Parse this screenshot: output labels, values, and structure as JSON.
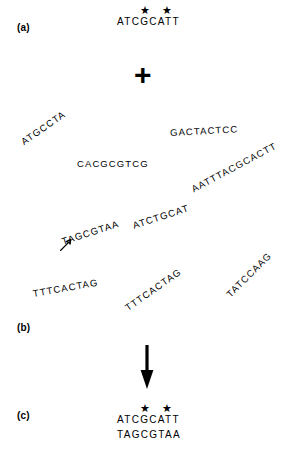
{
  "figure": {
    "background_color": "#ffffff",
    "ink_color": "#000000"
  },
  "panels": {
    "a": {
      "label": "(a)"
    },
    "b": {
      "label": "(b)"
    },
    "c": {
      "label": "(c)"
    }
  },
  "panel_a": {
    "probe_sequence": "ATCGCATT",
    "star_marker": "★",
    "star_count": 2,
    "starred_positions": [
      3,
      5
    ],
    "plus_symbol": "+"
  },
  "panel_b": {
    "scattered_sequences": [
      {
        "text": "ATGCCTA",
        "rotation": -35
      },
      {
        "text": "GACTACTCC",
        "rotation": -3
      },
      {
        "text": "CACGCGTCG",
        "rotation": 0
      },
      {
        "text": "AATTTACGCACTT",
        "rotation": -28
      },
      {
        "text": "ATCTGCAT",
        "rotation": -18
      },
      {
        "text": "TAGCGTAA",
        "rotation": -18
      },
      {
        "text": "TTTCACTAG",
        "rotation": -10
      },
      {
        "text": "TTTCACTAG",
        "rotation": -35
      },
      {
        "text": "TATCCAAG",
        "rotation": -45
      }
    ],
    "highlighted_sequence": "TAGCGTAA",
    "pointer_icon": "open-arrow-up-right-icon",
    "transition_icon": "down-arrow-icon"
  },
  "panel_c": {
    "top_strand": "ATCGCATT",
    "bottom_strand": "TAGCGTAA",
    "star_marker": "★",
    "star_count": 2,
    "starred_positions": [
      3,
      5
    ]
  }
}
